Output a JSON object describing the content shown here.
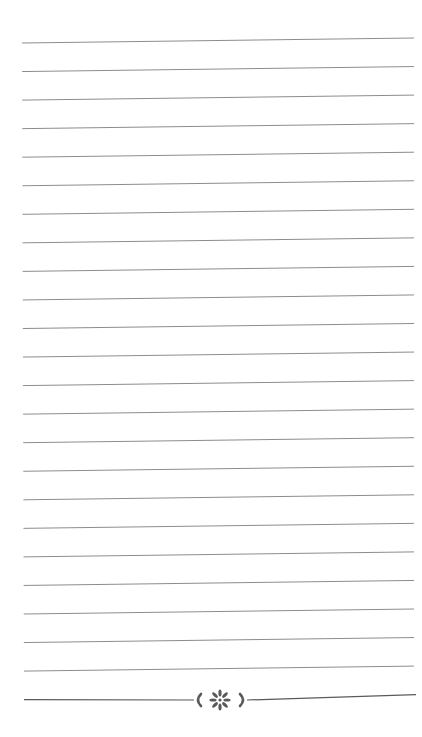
{
  "page": {
    "type": "lined-notebook-page",
    "background": "#ffffff",
    "line_color": "#8c8c8c",
    "line_width": 1,
    "line_count": 24,
    "lines": {
      "x_start": 22,
      "x_end": 414,
      "first_y_left": 43,
      "first_y_right": 38,
      "spacing": 28.55
    }
  },
  "ornament": {
    "name": "flower-divider",
    "color": "#5a5a5a",
    "center_x": 220,
    "center_y": 700,
    "left_bracket_x": 198,
    "right_bracket_x": 243,
    "petal_count": 8
  }
}
